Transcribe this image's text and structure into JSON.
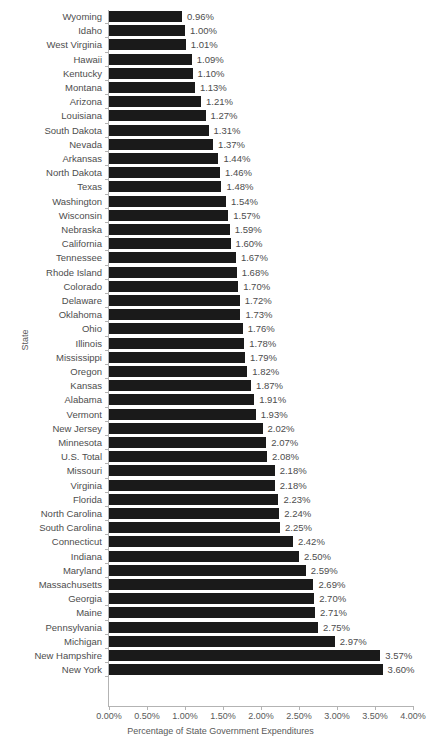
{
  "chart_data": {
    "type": "bar",
    "orientation": "horizontal",
    "title": "",
    "xlabel": "Percentage of State Government Expenditures",
    "ylabel": "State",
    "xlim": [
      0,
      4
    ],
    "xtick_labels": [
      "0.00%",
      "0.50%",
      "1.00%",
      "1.50%",
      "2.00%",
      "2.50%",
      "3.00%",
      "3.50%",
      "4.00%"
    ],
    "xtick_values": [
      0,
      0.5,
      1.0,
      1.5,
      2.0,
      2.5,
      3.0,
      3.5,
      4.0
    ],
    "grid": false,
    "legend": null,
    "bar_color": "#1a1a1a",
    "categories": [
      "Wyoming",
      "Idaho",
      "West Virginia",
      "Hawaii",
      "Kentucky",
      "Montana",
      "Arizona",
      "Louisiana",
      "South Dakota",
      "Nevada",
      "Arkansas",
      "North Dakota",
      "Texas",
      "Washington",
      "Wisconsin",
      "Nebraska",
      "California",
      "Tennessee",
      "Rhode Island",
      "Colorado",
      "Delaware",
      "Oklahoma",
      "Ohio",
      "Illinois",
      "Mississippi",
      "Oregon",
      "Kansas",
      "Alabama",
      "Vermont",
      "New Jersey",
      "Minnesota",
      "U.S. Total",
      "Missouri",
      "Virginia",
      "Florida",
      "North Carolina",
      "South Carolina",
      "Connecticut",
      "Indiana",
      "Maryland",
      "Massachusetts",
      "Georgia",
      "Maine",
      "Pennsylvania",
      "Michigan",
      "New Hampshire",
      "New York"
    ],
    "values": [
      0.96,
      1.0,
      1.01,
      1.09,
      1.1,
      1.13,
      1.21,
      1.27,
      1.31,
      1.37,
      1.44,
      1.46,
      1.48,
      1.54,
      1.57,
      1.59,
      1.6,
      1.67,
      1.68,
      1.7,
      1.72,
      1.73,
      1.76,
      1.78,
      1.79,
      1.82,
      1.87,
      1.91,
      1.93,
      2.02,
      2.07,
      2.08,
      2.18,
      2.18,
      2.23,
      2.24,
      2.25,
      2.42,
      2.5,
      2.59,
      2.69,
      2.7,
      2.71,
      2.75,
      2.97,
      3.57,
      3.6
    ],
    "value_labels": [
      "0.96%",
      "1.00%",
      "1.01%",
      "1.09%",
      "1.10%",
      "1.13%",
      "1.21%",
      "1.27%",
      "1.31%",
      "1.37%",
      "1.44%",
      "1.46%",
      "1.48%",
      "1.54%",
      "1.57%",
      "1.59%",
      "1.60%",
      "1.67%",
      "1.68%",
      "1.70%",
      "1.72%",
      "1.73%",
      "1.76%",
      "1.78%",
      "1.79%",
      "1.82%",
      "1.87%",
      "1.91%",
      "1.93%",
      "2.02%",
      "2.07%",
      "2.08%",
      "2.18%",
      "2.18%",
      "2.23%",
      "2.24%",
      "2.25%",
      "2.42%",
      "2.50%",
      "2.59%",
      "2.69%",
      "2.70%",
      "2.71%",
      "2.75%",
      "2.97%",
      "3.57%",
      "3.60%"
    ]
  }
}
